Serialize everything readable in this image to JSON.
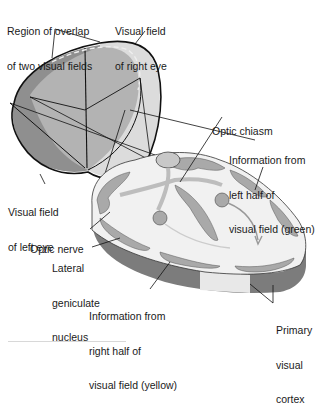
{
  "figure": {
    "colors": {
      "left_field_dark": "#8f8f8f",
      "overlap_mid": "#b5b5b5",
      "right_field_light": "#dcdcdc",
      "brain_gray_matter": "#a9a9a9",
      "brain_white_matter": "#f1f1f1",
      "brain_cut_face": "#7c7c7c",
      "outline": "#111111"
    }
  },
  "labels": {
    "overlap_region": [
      "Region of overlap",
      "of two visual fields"
    ],
    "right_eye_field": [
      "Visual field",
      "of right eye"
    ],
    "optic_chiasm": [
      "Optic chiasm"
    ],
    "left_half_info": [
      "Information from",
      "left half of",
      "visual field (green)"
    ],
    "left_eye_field": [
      "Visual field",
      "of left eye"
    ],
    "optic_nerve": [
      "Optic nerve"
    ],
    "lateral_geniculate": [
      "Lateral",
      "geniculate",
      "nucleus"
    ],
    "right_half_info": [
      "Information from",
      "right half of",
      "visual field (yellow)"
    ],
    "primary_visual_cortex": [
      "Primary",
      "visual",
      "cortex"
    ]
  }
}
